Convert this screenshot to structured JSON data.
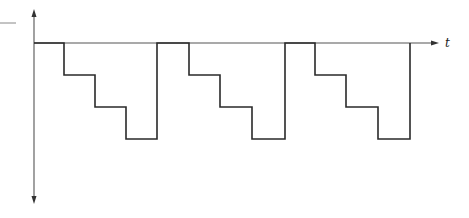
{
  "diagram": {
    "type": "staircase-waveform",
    "x_axis_label": "t",
    "y_axis_label": "",
    "colors": {
      "axis": "#555555",
      "waveform": "#2a2a2a",
      "background": "#ffffff"
    },
    "waveform": {
      "description": "Periodic negative staircase: level 0, then three descending equal steps, then return to 0",
      "levels": [
        0,
        -1,
        -2,
        -3
      ],
      "cycles": 3,
      "points": [
        [
          34,
          43
        ],
        [
          64,
          43
        ],
        [
          64,
          75
        ],
        [
          95,
          75
        ],
        [
          95,
          107
        ],
        [
          126,
          107
        ],
        [
          126,
          139
        ],
        [
          157,
          139
        ],
        [
          157,
          43
        ],
        [
          189,
          43
        ],
        [
          189,
          75
        ],
        [
          220,
          75
        ],
        [
          220,
          107
        ],
        [
          252,
          107
        ],
        [
          252,
          139
        ],
        [
          285,
          139
        ],
        [
          285,
          43
        ],
        [
          315,
          43
        ],
        [
          315,
          75
        ],
        [
          346,
          75
        ],
        [
          346,
          107
        ],
        [
          378,
          107
        ],
        [
          378,
          139
        ],
        [
          410,
          139
        ],
        [
          410,
          43
        ]
      ]
    }
  }
}
